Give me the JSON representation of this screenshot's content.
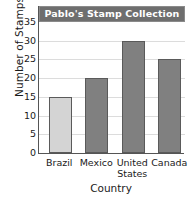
{
  "chart_data": {
    "type": "bar",
    "title": "Pablo's Stamp Collection",
    "xlabel": "Country",
    "ylabel": "Number of Stamps",
    "categories": [
      "Brazil",
      "Mexico",
      "United States",
      "Canada"
    ],
    "category_lines": [
      [
        "Brazil"
      ],
      [
        "Mexico"
      ],
      [
        "United",
        "States"
      ],
      [
        "Canada"
      ]
    ],
    "values": [
      15,
      20,
      30,
      25
    ],
    "ylim": [
      0,
      35
    ],
    "ytick_labels": [
      "0",
      "5",
      "10",
      "15",
      "20",
      "25",
      "30",
      "35"
    ],
    "ytick_values": [
      0,
      5,
      10,
      15,
      20,
      25,
      30,
      35
    ],
    "ytick_step": 5,
    "grid": true,
    "legend": false,
    "bar_colors": [
      "#d4d4d4",
      "#808080",
      "#808080",
      "#808080"
    ],
    "bar_border_color": "#5a5a5a",
    "gridline_color": "#dcdcdc",
    "axis_color": "#555555",
    "title_banner_color": "#6e6e6e",
    "title_text_color": "#ffffff",
    "background_color": "#ffffff"
  }
}
